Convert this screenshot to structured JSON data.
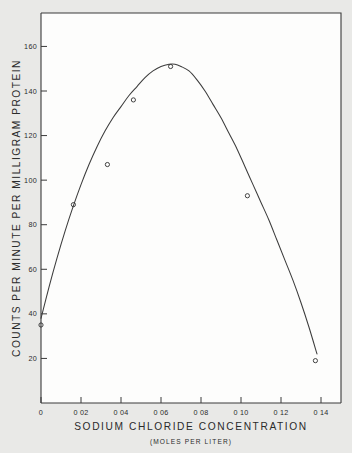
{
  "figure": {
    "background_color": "#e9e9e7",
    "plot_background_color": "#fdfdfc",
    "ink_color": "#3a3a3a"
  },
  "chart_data": {
    "type": "scatter",
    "title": "",
    "xlabel": "SODIUM CHLORIDE CONCENTRATION",
    "xlabel_units": "(MOLES PER LITER)",
    "ylabel": "COUNTS PER MINUTE PER MILLIGRAM PROTEIN",
    "xlim": [
      0,
      0.15
    ],
    "ylim": [
      0,
      175
    ],
    "grid": false,
    "legend": null,
    "x_tick_values": [
      0,
      0.02,
      0.04,
      0.06,
      0.08,
      0.1,
      0.12,
      0.14
    ],
    "x_tick_labels": [
      "0",
      "0 02",
      "0 04",
      "0 06",
      "0 08",
      "0 10",
      "0 12",
      "0 14"
    ],
    "y_tick_values": [
      20,
      40,
      60,
      80,
      100,
      120,
      140,
      160
    ],
    "y_tick_labels": [
      "20",
      "40",
      "60",
      "80",
      "100",
      "120",
      "140",
      "160"
    ],
    "marker_style": "open-circle",
    "x": [
      0.0,
      0.0162,
      0.0332,
      0.0462,
      0.0648,
      0.1032,
      0.1372
    ],
    "y": [
      35,
      89,
      107,
      136,
      151,
      93,
      19
    ],
    "points": [
      {
        "x": 0.0,
        "y": 35
      },
      {
        "x": 0.0162,
        "y": 89
      },
      {
        "x": 0.0332,
        "y": 107
      },
      {
        "x": 0.0462,
        "y": 136
      },
      {
        "x": 0.0648,
        "y": 151
      },
      {
        "x": 0.1032,
        "y": 93
      },
      {
        "x": 0.1372,
        "y": 19
      }
    ],
    "fitted_curve": {
      "description": "smooth fitted curve rising to a maximum near 0.067 M then declining",
      "peak_x": 0.067,
      "peak_y": 152,
      "x": [
        0.0,
        0.004,
        0.008,
        0.012,
        0.016,
        0.02,
        0.024,
        0.028,
        0.032,
        0.036,
        0.04,
        0.044,
        0.048,
        0.052,
        0.056,
        0.06,
        0.064,
        0.067,
        0.07,
        0.074,
        0.078,
        0.082,
        0.086,
        0.09,
        0.094,
        0.098,
        0.102,
        0.106,
        0.11,
        0.114,
        0.118,
        0.122,
        0.126,
        0.13,
        0.134,
        0.138
      ],
      "y": [
        38,
        52,
        65,
        77,
        88,
        98,
        107,
        115,
        122,
        128,
        133,
        138,
        142,
        146,
        149,
        151,
        152,
        152,
        151,
        149,
        145,
        140,
        134,
        128,
        121,
        114,
        106,
        98,
        90,
        82,
        73,
        64,
        55,
        45,
        34,
        22
      ]
    }
  }
}
